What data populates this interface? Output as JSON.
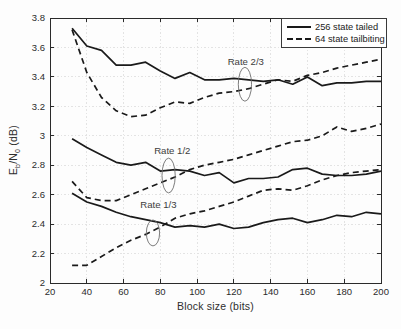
{
  "chart_data": {
    "type": "line",
    "title": "",
    "xlabel": "Block size (bits)",
    "ylabel": "E_b/N_0 (dB)",
    "ylabel_parts": [
      {
        "text": "E"
      },
      {
        "text": "b",
        "sub": true
      },
      {
        "text": "/N"
      },
      {
        "text": "0",
        "sub": true
      },
      {
        "text": " (dB)"
      }
    ],
    "xlim": [
      20,
      200
    ],
    "ylim": [
      2,
      3.8
    ],
    "xticks": [
      20,
      40,
      60,
      80,
      100,
      120,
      140,
      160,
      180,
      200
    ],
    "yticks": [
      2,
      2.2,
      2.4,
      2.6,
      2.8,
      3,
      3.2,
      3.4,
      3.6,
      3.8
    ],
    "grid": true,
    "legend_position": "top-right",
    "legend": [
      {
        "label": "256 state tailed",
        "style": "solid"
      },
      {
        "label": "64 state tailbiting",
        "style": "dashed"
      }
    ],
    "x": [
      32,
      40,
      48,
      56,
      64,
      72,
      80,
      88,
      96,
      104,
      112,
      120,
      128,
      136,
      144,
      152,
      160,
      168,
      176,
      184,
      192,
      200
    ],
    "series": [
      {
        "name": "256 state tailed",
        "rate": "Rate 2/3",
        "style": "solid",
        "values": [
          3.73,
          3.61,
          3.58,
          3.48,
          3.48,
          3.5,
          3.44,
          3.39,
          3.43,
          3.38,
          3.38,
          3.39,
          3.38,
          3.37,
          3.38,
          3.35,
          3.4,
          3.34,
          3.36,
          3.36,
          3.37,
          3.37
        ]
      },
      {
        "name": "64 state tailbiting",
        "rate": "Rate 2/3",
        "style": "dashed",
        "values": [
          3.72,
          3.43,
          3.26,
          3.17,
          3.13,
          3.14,
          3.19,
          3.23,
          3.22,
          3.26,
          3.29,
          3.3,
          3.32,
          3.35,
          3.38,
          3.37,
          3.41,
          3.43,
          3.46,
          3.48,
          3.5,
          3.52
        ]
      },
      {
        "name": "256 state tailed",
        "rate": "Rate 1/2",
        "style": "solid",
        "values": [
          2.98,
          2.92,
          2.87,
          2.82,
          2.8,
          2.82,
          2.76,
          2.77,
          2.76,
          2.73,
          2.75,
          2.68,
          2.71,
          2.71,
          2.72,
          2.77,
          2.78,
          2.74,
          2.73,
          2.73,
          2.74,
          2.76
        ]
      },
      {
        "name": "64 state tailbiting",
        "rate": "Rate 1/2",
        "style": "dashed",
        "values": [
          2.69,
          2.58,
          2.56,
          2.56,
          2.6,
          2.64,
          2.68,
          2.72,
          2.77,
          2.8,
          2.82,
          2.84,
          2.87,
          2.9,
          2.93,
          2.96,
          2.97,
          3.0,
          3.06,
          3.03,
          3.05,
          3.08
        ]
      },
      {
        "name": "256 state tailed",
        "rate": "Rate 1/3",
        "style": "solid",
        "values": [
          2.61,
          2.55,
          2.52,
          2.48,
          2.45,
          2.43,
          2.41,
          2.38,
          2.39,
          2.38,
          2.4,
          2.37,
          2.38,
          2.41,
          2.43,
          2.44,
          2.41,
          2.43,
          2.46,
          2.45,
          2.48,
          2.47
        ]
      },
      {
        "name": "64 state tailbiting",
        "rate": "Rate 1/3",
        "style": "dashed",
        "values": [
          2.12,
          2.12,
          2.18,
          2.24,
          2.29,
          2.33,
          2.38,
          2.44,
          2.47,
          2.49,
          2.52,
          2.55,
          2.59,
          2.63,
          2.64,
          2.63,
          2.66,
          2.7,
          2.73,
          2.75,
          2.76,
          2.77
        ]
      }
    ],
    "annotations": [
      {
        "label": "Rate 2/3",
        "label_x": 126.5,
        "label_y": 3.5,
        "ellipse": {
          "cx": 126,
          "cy": 3.35,
          "rx_bits": 3.6,
          "ry_db": 0.115
        }
      },
      {
        "label": "Rate 1/2",
        "label_x": 86.5,
        "label_y": 2.9,
        "ellipse": {
          "cx": 84.5,
          "cy": 2.73,
          "rx_bits": 3.6,
          "ry_db": 0.118
        }
      },
      {
        "label": "Rate 1/3",
        "label_x": 79,
        "label_y": 2.53,
        "ellipse": {
          "cx": 76,
          "cy": 2.34,
          "rx_bits": 3.6,
          "ry_db": 0.088
        }
      }
    ],
    "colors": {
      "line": "#1a1a1a",
      "axis": "#2a2a2a",
      "grid": "#e3e3e3",
      "tick_text": "#2b2b2b",
      "annotation_text": "#3c3c3c",
      "annotation_ellipse": "#6d6d6d",
      "background": "#ffffff"
    }
  }
}
